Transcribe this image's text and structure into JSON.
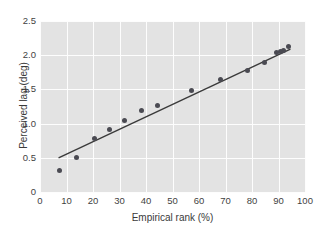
{
  "chart_data": {
    "type": "scatter",
    "title": "",
    "xlabel": "Empirical rank (%)",
    "ylabel": "Perceived lag (deg)",
    "xlim": [
      0,
      100
    ],
    "ylim": [
      0,
      2.5
    ],
    "xticks": [
      0,
      10,
      20,
      30,
      40,
      50,
      60,
      70,
      80,
      90,
      100
    ],
    "xtick_labels": [
      "0",
      "10",
      "20",
      "30",
      "40",
      "50",
      "60",
      "70",
      "80",
      "90",
      "100"
    ],
    "yticks": [
      0,
      0.5,
      1.0,
      1.5,
      2.0,
      2.5
    ],
    "ytick_labels": [
      "0",
      "0.5",
      "1.0",
      "1.5",
      "2.0",
      "2.5"
    ],
    "grid": true,
    "grid_color": "#fdfdfd",
    "panel_color": "#e3e3e3",
    "marker_color": "#4a4a52",
    "line_color": "#3a3a3a",
    "legend": null,
    "x": [
      7.5,
      13.7,
      20.4,
      26.4,
      31.9,
      38.3,
      44.4,
      57.3,
      68.1,
      78.4,
      84.7,
      89.3,
      90.6,
      91.8,
      93.6
    ],
    "y": [
      0.31,
      0.51,
      0.78,
      0.91,
      1.05,
      1.19,
      1.26,
      1.48,
      1.65,
      1.78,
      1.89,
      2.04,
      2.05,
      2.07,
      2.12
    ],
    "fit_line": {
      "x": [
        7.0,
        94.5
      ],
      "y": [
        0.5,
        2.09
      ]
    }
  }
}
